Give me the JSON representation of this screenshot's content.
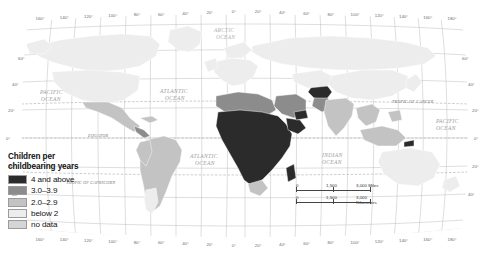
{
  "chart_data": {
    "type": "map",
    "title": "Children per childbearing years",
    "subtitle": "",
    "projection": "Robinson world map",
    "legend_position": "bottom-left",
    "legend": {
      "title_line1": "Children per",
      "title_line2": "childbearing years",
      "classes": [
        {
          "label": "4 and above",
          "color": "#2b2b2b",
          "min": 4.0,
          "max": null
        },
        {
          "label": "3.0–3.9",
          "color": "#8c8c8c",
          "min": 3.0,
          "max": 3.9
        },
        {
          "label": "2.0–2.9",
          "color": "#c3c3c3",
          "min": 2.0,
          "max": 2.9
        },
        {
          "label": "below 2",
          "color": "#ededed",
          "min": null,
          "max": 2.0
        },
        {
          "label": "no data",
          "color": "#d5d5d5",
          "min": null,
          "max": null
        }
      ]
    },
    "scale_bars": [
      {
        "unit": "Miles",
        "ticks": [
          "0",
          "1,500",
          "3,000"
        ],
        "unit_label": "3,000 Miles"
      },
      {
        "unit": "Kilometers",
        "ticks": [
          "0",
          "1,500",
          "3,000"
        ],
        "unit_label": "3,000 Kilometers"
      }
    ],
    "graticule": {
      "longitude_labels_top": [
        "160°",
        "140°",
        "120°",
        "100°",
        "80°",
        "60°",
        "40°",
        "20°",
        "0°",
        "20°",
        "40°",
        "60°",
        "80°",
        "100°",
        "120°",
        "140°",
        "160°",
        "180°"
      ],
      "longitude_labels_bottom": [
        "160°",
        "140°",
        "120°",
        "100°",
        "80°",
        "60°",
        "40°",
        "20°",
        "0°",
        "20°",
        "40°",
        "60°",
        "80°",
        "100°",
        "120°",
        "140°",
        "160°",
        "180°"
      ],
      "latitude_labels_left": [
        "60°",
        "40°",
        "20°",
        "0°",
        "20°",
        "40°"
      ],
      "latitude_labels_right": [
        "60°",
        "40°",
        "20°",
        "0°",
        "20°",
        "40°"
      ]
    },
    "map_labels": {
      "arctic_ocean": "ARCTIC\nOCEAN",
      "arctic_line1": "ARCTIC",
      "arctic_line2": "OCEAN",
      "pacific_nw_line1": "PACIFIC",
      "pacific_nw_line2": "OCEAN",
      "atlantic_n_line1": "ATLANTIC",
      "atlantic_n_line2": "OCEAN",
      "atlantic_s_line1": "ATLANTIC",
      "atlantic_s_line2": "OCEAN",
      "indian_line1": "INDIAN",
      "indian_line2": "OCEAN",
      "pacific_se_line1": "PACIFIC",
      "pacific_se_line2": "OCEAN",
      "equator": "EQUATOR",
      "tropic_cancer": "TROPIC OF CANCER",
      "tropic_capricorn": "TROPIC OF CAPRICORN"
    },
    "regions_highlighted": {
      "highest_4_and_above": "Sub-Saharan Africa, Afghanistan, Yemen, Timor-Leste",
      "mid_3_to_3_9": "North Africa, Middle East, Pakistan, parts of Central America",
      "low_below_2": "Europe, Russia, China, Japan, Canada, Australia"
    }
  }
}
